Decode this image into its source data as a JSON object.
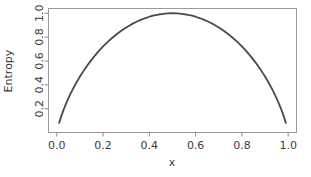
{
  "chart_data": {
    "type": "line",
    "title": "",
    "subtitle": "",
    "xlabel": "x",
    "ylabel": "Entropy",
    "xlim": [
      -0.036,
      1.036
    ],
    "ylim": [
      0.0,
      1.04
    ],
    "grid": false,
    "legend": null,
    "legend_position": "none",
    "annotations": [],
    "xticks": [
      "0.0",
      "0.2",
      "0.4",
      "0.6",
      "0.8",
      "1.0"
    ],
    "xtick_values": [
      0.0,
      0.2,
      0.4,
      0.6,
      0.8,
      1.0
    ],
    "yticks": [
      "0.2",
      "0.4",
      "0.6",
      "0.8",
      "1.0"
    ],
    "ytick_values": [
      0.2,
      0.4,
      0.6,
      0.8,
      1.0
    ],
    "series": [
      {
        "name": "Binary entropy",
        "formula": "H(x) = -x*log2(x) - (1-x)*log2(1-x)",
        "x": [
          0.01,
          0.02,
          0.03,
          0.04,
          0.05,
          0.06,
          0.07,
          0.08,
          0.09,
          0.1,
          0.12,
          0.14,
          0.16,
          0.18,
          0.2,
          0.22,
          0.24,
          0.26,
          0.28,
          0.3,
          0.32,
          0.34,
          0.36,
          0.38,
          0.4,
          0.42,
          0.44,
          0.46,
          0.48,
          0.5,
          0.52,
          0.54,
          0.56,
          0.58,
          0.6,
          0.62,
          0.64,
          0.66,
          0.68,
          0.7,
          0.72,
          0.74,
          0.76,
          0.78,
          0.8,
          0.82,
          0.84,
          0.86,
          0.88,
          0.9,
          0.91,
          0.92,
          0.93,
          0.94,
          0.95,
          0.96,
          0.97,
          0.98,
          0.99
        ],
        "y": [
          0.0808,
          0.1414,
          0.1944,
          0.2423,
          0.2864,
          0.3274,
          0.3659,
          0.4022,
          0.4365,
          0.469,
          0.5294,
          0.5842,
          0.6343,
          0.6801,
          0.7219,
          0.7602,
          0.795,
          0.8267,
          0.8555,
          0.8813,
          0.9044,
          0.9249,
          0.9427,
          0.958,
          0.971,
          0.9815,
          0.9896,
          0.9954,
          0.9988,
          1.0,
          0.9988,
          0.9954,
          0.9896,
          0.9815,
          0.971,
          0.958,
          0.9427,
          0.9249,
          0.9044,
          0.8813,
          0.8555,
          0.8267,
          0.795,
          0.7602,
          0.7219,
          0.6801,
          0.6343,
          0.5842,
          0.5294,
          0.469,
          0.4365,
          0.4022,
          0.3659,
          0.3274,
          0.2864,
          0.2423,
          0.1944,
          0.1414,
          0.0808
        ],
        "color": "#4a4a4a",
        "line_width": 1.8,
        "style": "solid"
      }
    ],
    "colors": {
      "line": "#4a4a4a",
      "frame": "#9a9a9a",
      "tick": "#8a8a8a",
      "text": "#3c3c3c",
      "background": "#ffffff"
    }
  }
}
